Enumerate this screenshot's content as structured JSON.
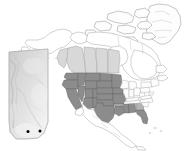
{
  "figure": {
    "background_color": "#ffffff",
    "width_px": 185,
    "height_px": 151
  },
  "legend_colors": {
    "shaded_range_fill": "#8c8c8c",
    "partial_range_fill": "#b4b4b4",
    "canada_province_fill": "#d8d8d8",
    "unshaded_land_fill": "#ffffff",
    "border_stroke": "#8f8f8f",
    "site_dot_color": "#000000"
  },
  "main_map": {
    "name": "north-america-map",
    "regions": [
      {
        "name": "Greenland",
        "fill": "unshaded"
      },
      {
        "name": "Alaska",
        "fill": "unshaded"
      },
      {
        "name": "Canada (north/east)",
        "fill": "unshaded"
      },
      {
        "name": "British Columbia",
        "fill": "light"
      },
      {
        "name": "Alberta",
        "fill": "light"
      },
      {
        "name": "Saskatchewan",
        "fill": "light"
      },
      {
        "name": "Manitoba",
        "fill": "light"
      },
      {
        "name": "Mexico",
        "fill": "unshaded"
      }
    ],
    "shaded_states": [
      "Washington",
      "Oregon",
      "California",
      "Idaho",
      "Nevada",
      "Montana",
      "Wyoming",
      "Utah",
      "Colorado",
      "Arizona",
      "New Mexico",
      "North Dakota",
      "South Dakota",
      "Nebraska",
      "Kansas",
      "Oklahoma",
      "Texas",
      "Minnesota",
      "Iowa",
      "Missouri",
      "Louisiana",
      "Mississippi",
      "Alabama",
      "Florida"
    ],
    "partial_states": [
      "Arkansas",
      "Georgia"
    ],
    "unshaded_states": [
      "Wisconsin",
      "Illinois",
      "Michigan",
      "Indiana",
      "Ohio",
      "Kentucky",
      "Tennessee",
      "West Virginia",
      "Virginia",
      "North Carolina",
      "South Carolina",
      "Pennsylvania",
      "New York",
      "Maine",
      "Vermont",
      "New Hampshire",
      "Massachusetts",
      "Connecticut",
      "Rhode Island",
      "New Jersey",
      "Delaware",
      "Maryland"
    ]
  },
  "inset_map": {
    "name": "alberta-inset-map",
    "region_label": "Alberta",
    "terrain_shading": "grayscale elevation relief",
    "site_count": 2,
    "sites": [
      {
        "id": "site-1",
        "x_pct": 52,
        "y_pct": 86
      },
      {
        "id": "site-2",
        "x_pct": 77,
        "y_pct": 85
      }
    ]
  }
}
